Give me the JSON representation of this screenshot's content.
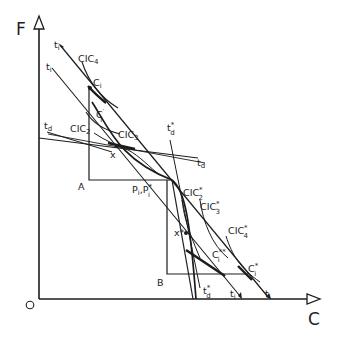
{
  "diagram": {
    "axes": {
      "y_label": "F",
      "x_label": "C",
      "origin_label": "O"
    },
    "points": {
      "A": "A",
      "B": "B",
      "x": "x",
      "x_star": "x*",
      "P": "P",
      "P_sub": "i",
      "P_comma": ",",
      "P_star": "P",
      "P_star_sub": "i",
      "P_star_sup": "*",
      "Ci": "C",
      "Ci_sub": "i",
      "Ci_prime": "C",
      "Ci_prime_sub": "i",
      "Ci_prime_sup": "′",
      "Ci_star": "C",
      "Ci_star_sub": "i",
      "Ci_star_sup": "*",
      "Ci_starstar": "C",
      "Ci_starstar_sub": "i",
      "Ci_starstar_sup": "**"
    },
    "curves": {
      "CIC2": "CIC",
      "CIC2_sub": "2",
      "CIC3": "CIC",
      "CIC3_sub": "3",
      "CIC4": "CIC",
      "CIC4_sub": "4",
      "CIC2s": "CIC",
      "CIC2s_sub": "2",
      "CIC2s_sup": "*",
      "CIC3s": "CIC",
      "CIC3s_sub": "3",
      "CIC3s_sup": "*",
      "CIC4s": "CIC",
      "CIC4s_sub": "4",
      "CIC4s_sup": "*"
    },
    "lines": {
      "ti_top": "t",
      "ti_top_sub": "i",
      "ti_mid": "t",
      "ti_mid_sub": "i",
      "td_left": "t",
      "td_left_sub": "d",
      "td_right": "t",
      "td_right_sub": "d",
      "tds_top": "t",
      "tds_top_sub": "d",
      "tds_top_sup": "*",
      "tds_bot": "t",
      "tds_bot_sub": "d",
      "tds_bot_sup": "*",
      "ti_bot1": "t",
      "ti_bot1_sub": "i",
      "ti_bot2": "t",
      "ti_bot2_sub": "i"
    }
  }
}
